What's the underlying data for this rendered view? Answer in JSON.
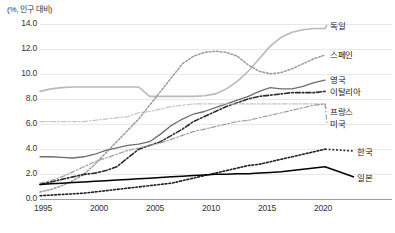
{
  "axis_title": "(%, 인구 대비)",
  "y_ticks": [
    "14.0",
    "12.0",
    "10.0",
    "8.0",
    "6.0",
    "4.0",
    "2.0",
    "0.0"
  ],
  "x_ticks": [
    "1995",
    "2000",
    "2005",
    "2010",
    "2015",
    "2020"
  ],
  "series_labels": {
    "germany": "독일",
    "spain": "스페인",
    "uk": "영국",
    "italy": "이탈리아",
    "france": "프랑스",
    "usa": "미국",
    "korea": "한국",
    "japan": "일본"
  },
  "colors": {
    "germany": "#b9b9b9",
    "spain": "#9a9a9a",
    "uk": "#6e6e6e",
    "italy": "#2b2b2b",
    "france": "#c4c4c4",
    "usa": "#9d9d9d",
    "korea": "#1f1f1f",
    "japan": "#000000",
    "grid": "#e8e8e8",
    "axis": "#9e9e9e",
    "text": "#333333"
  },
  "chart_data": {
    "type": "line",
    "title": "",
    "subtitle": "",
    "xlabel": "",
    "ylabel": "(%, 인구 대비)",
    "xlim": [
      1995,
      2021
    ],
    "ylim": [
      0.0,
      14.0
    ],
    "ytick_values": [
      14.0,
      12.0,
      10.0,
      8.0,
      6.0,
      4.0,
      2.0,
      0.0
    ],
    "xtick_values": [
      1995,
      2000,
      2005,
      2010,
      2015,
      2020
    ],
    "grid": "horizontal",
    "legend": "right-inline-labels",
    "x": [
      1995,
      1996,
      1997,
      1998,
      1999,
      2000,
      2001,
      2002,
      2003,
      2004,
      2005,
      2006,
      2007,
      2008,
      2009,
      2010,
      2011,
      2012,
      2013,
      2014,
      2015,
      2016,
      2017,
      2018,
      2019,
      2020,
      2021
    ],
    "series": [
      {
        "name": "독일",
        "key": "germany",
        "style": "solid",
        "values": [
          8.6,
          8.8,
          8.9,
          8.95,
          8.95,
          8.95,
          8.95,
          8.95,
          8.95,
          8.95,
          8.2,
          8.2,
          8.2,
          8.2,
          8.2,
          8.25,
          8.4,
          8.8,
          9.4,
          10.2,
          11.2,
          12.2,
          12.9,
          13.3,
          13.5,
          13.6,
          13.6
        ]
      },
      {
        "name": "스페인",
        "key": "spain",
        "style": "dotted",
        "values": [
          0.6,
          0.8,
          1.1,
          1.5,
          2.0,
          2.8,
          3.7,
          4.6,
          5.5,
          6.4,
          7.5,
          8.6,
          9.7,
          10.8,
          11.4,
          11.7,
          11.8,
          11.7,
          11.4,
          10.7,
          10.2,
          10.0,
          10.1,
          10.4,
          10.8,
          11.2,
          11.5
        ]
      },
      {
        "name": "영국",
        "key": "uk",
        "style": "solid",
        "values": [
          3.4,
          3.4,
          3.35,
          3.3,
          3.4,
          3.6,
          3.9,
          4.1,
          4.3,
          4.4,
          4.6,
          5.2,
          5.9,
          6.4,
          6.8,
          7.0,
          7.3,
          7.6,
          7.9,
          8.2,
          8.6,
          8.9,
          8.8,
          8.8,
          9.0,
          9.3,
          9.5
        ]
      },
      {
        "name": "이탈리아",
        "key": "italy",
        "style": "dashdot",
        "values": [
          1.2,
          1.4,
          1.6,
          1.8,
          2.0,
          2.1,
          2.3,
          2.6,
          3.3,
          4.0,
          4.3,
          4.6,
          5.1,
          5.6,
          6.2,
          6.6,
          7.0,
          7.4,
          7.7,
          8.0,
          8.2,
          8.3,
          8.4,
          8.5,
          8.5,
          8.5,
          8.6
        ]
      },
      {
        "name": "프랑스",
        "key": "france",
        "style": "dashdot",
        "values": [
          6.2,
          6.2,
          6.2,
          6.2,
          6.2,
          6.3,
          6.4,
          6.5,
          6.6,
          6.9,
          7.0,
          7.2,
          7.4,
          7.5,
          7.6,
          7.6,
          7.6,
          7.6,
          7.6,
          7.6,
          7.6,
          7.6,
          7.6,
          7.6,
          7.6,
          7.6,
          7.6
        ]
      },
      {
        "name": "미국",
        "key": "usa",
        "style": "dashdot",
        "values": [
          1.3,
          1.5,
          1.8,
          2.2,
          2.6,
          3.0,
          3.3,
          3.6,
          3.9,
          4.1,
          4.3,
          4.5,
          4.8,
          5.1,
          5.4,
          5.6,
          5.8,
          6.0,
          6.2,
          6.3,
          6.5,
          6.7,
          6.9,
          7.1,
          7.3,
          7.5,
          7.6
        ]
      },
      {
        "name": "한국",
        "key": "korea",
        "style": "dotted",
        "values": [
          0.3,
          0.35,
          0.4,
          0.45,
          0.5,
          0.6,
          0.7,
          0.8,
          0.9,
          1.0,
          1.1,
          1.2,
          1.3,
          1.5,
          1.7,
          1.9,
          2.1,
          2.3,
          2.5,
          2.7,
          2.8,
          3.0,
          3.2,
          3.4,
          3.6,
          3.8,
          4.0
        ]
      },
      {
        "name": "일본",
        "key": "japan",
        "style": "solid",
        "values": [
          1.2,
          1.25,
          1.3,
          1.35,
          1.4,
          1.45,
          1.5,
          1.55,
          1.6,
          1.65,
          1.7,
          1.75,
          1.8,
          1.85,
          1.9,
          1.95,
          2.0,
          2.0,
          2.05,
          2.05,
          2.1,
          2.15,
          2.2,
          2.3,
          2.4,
          2.5,
          2.6
        ]
      }
    ]
  },
  "label_positions": {
    "germany": {
      "x": 330,
      "y": 19
    },
    "spain": {
      "x": 330,
      "y": 48
    },
    "uk": {
      "x": 330,
      "y": 73
    },
    "italy": {
      "x": 330,
      "y": 85
    },
    "france": {
      "x": 330,
      "y": 105
    },
    "usa": {
      "x": 330,
      "y": 117
    },
    "korea": {
      "x": 357,
      "y": 145
    },
    "japan": {
      "x": 357,
      "y": 171
    }
  }
}
